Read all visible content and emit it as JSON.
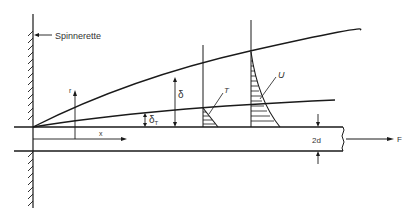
{
  "diagram": {
    "type": "boundary layer on a moving fiber (spinning)",
    "labels": {
      "spinnerette": "Spinnerette",
      "r_axis": "r",
      "x_axis": "x",
      "delta": "δ",
      "delta_t": "δ",
      "delta_t_sub": "T",
      "temperature_profile": "T",
      "velocity_profile": "U",
      "diameter": "2d",
      "force": "F"
    },
    "colors": {
      "line": "#1a1a1a",
      "text": "#333333",
      "background": "#ffffff"
    }
  }
}
